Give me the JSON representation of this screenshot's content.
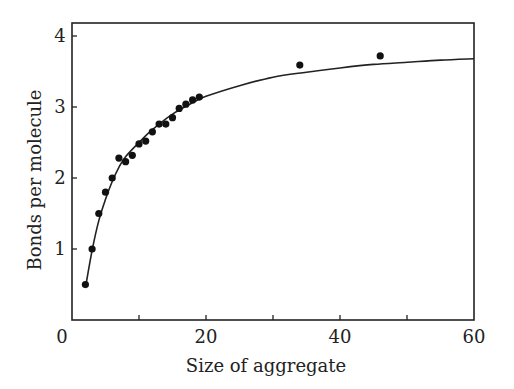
{
  "chart_data": {
    "type": "scatter",
    "title": "",
    "xlabel": "Size of aggregate",
    "ylabel": "Bonds per molecule",
    "xlim": [
      0,
      60
    ],
    "ylim": [
      0,
      4.2
    ],
    "grid": false,
    "legend": null,
    "x_ticks": [
      0,
      10,
      20,
      30,
      40,
      50,
      60
    ],
    "x_tick_labels": [
      {
        "value": 0,
        "label": "0"
      },
      {
        "value": 20,
        "label": "20"
      },
      {
        "value": 40,
        "label": "40"
      },
      {
        "value": 60,
        "label": "60"
      }
    ],
    "y_ticks": [
      {
        "value": 1,
        "label": "1"
      },
      {
        "value": 2,
        "label": "2"
      },
      {
        "value": 3,
        "label": "3"
      },
      {
        "value": 4,
        "label": "4"
      }
    ],
    "series": [
      {
        "name": "Observed",
        "kind": "scatter",
        "points": [
          [
            2,
            0.5
          ],
          [
            3,
            1.0
          ],
          [
            4,
            1.5
          ],
          [
            5,
            1.8
          ],
          [
            6,
            2.0
          ],
          [
            7,
            2.28
          ],
          [
            8,
            2.23
          ],
          [
            9,
            2.32
          ],
          [
            10,
            2.48
          ],
          [
            11,
            2.52
          ],
          [
            12,
            2.65
          ],
          [
            13,
            2.76
          ],
          [
            14,
            2.76
          ],
          [
            15,
            2.85
          ],
          [
            16,
            2.98
          ],
          [
            17,
            3.04
          ],
          [
            18,
            3.1
          ],
          [
            19,
            3.14
          ],
          [
            34,
            3.59
          ],
          [
            46,
            3.72
          ]
        ]
      },
      {
        "name": "Fitted curve",
        "kind": "line",
        "points": [
          [
            2,
            0.45
          ],
          [
            3,
            0.98
          ],
          [
            4,
            1.4
          ],
          [
            5,
            1.7
          ],
          [
            6,
            1.95
          ],
          [
            7,
            2.15
          ],
          [
            8,
            2.3
          ],
          [
            10,
            2.5
          ],
          [
            12,
            2.68
          ],
          [
            15,
            2.9
          ],
          [
            18,
            3.06
          ],
          [
            20,
            3.15
          ],
          [
            25,
            3.3
          ],
          [
            30,
            3.42
          ],
          [
            35,
            3.49
          ],
          [
            40,
            3.55
          ],
          [
            45,
            3.6
          ],
          [
            50,
            3.63
          ],
          [
            55,
            3.66
          ],
          [
            60,
            3.68
          ]
        ]
      }
    ]
  }
}
